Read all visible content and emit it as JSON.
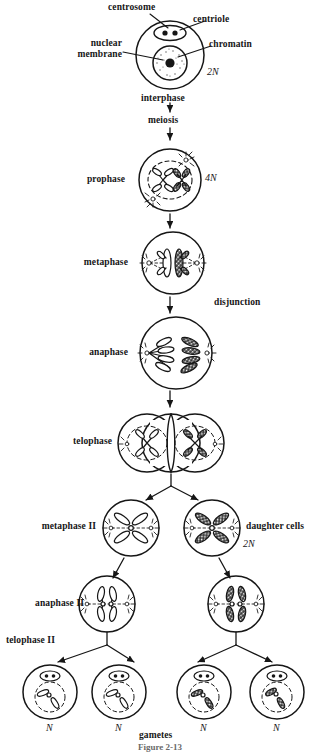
{
  "figure": {
    "caption": "Figure 2-13",
    "ink_color": "#161616",
    "paper_color": "#ffffff"
  },
  "callouts": [
    {
      "name": "centrosome",
      "label": "centrosome"
    },
    {
      "name": "centriole",
      "label": "centriole"
    },
    {
      "name": "nuclear-membrane",
      "label": "nuclear\nmembrane"
    },
    {
      "name": "chromatin",
      "label": "chromatin"
    }
  ],
  "stages": [
    {
      "name": "interphase",
      "label": "interphase",
      "ploidy": "2N"
    },
    {
      "name": "meiosis",
      "label": "meiosis",
      "ploidy": ""
    },
    {
      "name": "prophase",
      "label": "prophase",
      "ploidy": "4N"
    },
    {
      "name": "metaphase",
      "label": "metaphase",
      "ploidy": ""
    },
    {
      "name": "anaphase",
      "label": "anaphase",
      "ploidy": ""
    },
    {
      "name": "telophase",
      "label": "telophase",
      "ploidy": ""
    },
    {
      "name": "metaphase-2",
      "label": "metaphase II",
      "ploidy": ""
    },
    {
      "name": "anaphase-2",
      "label": "anaphase II",
      "ploidy": ""
    },
    {
      "name": "telophase-2",
      "label": "telophase II",
      "ploidy": ""
    }
  ],
  "annotations": {
    "disjunction": "disjunction",
    "daughter_cells": "daughter cells",
    "daughter_cells_ploidy": "2N",
    "gametes": "gametes",
    "interphase_ploidy": "2N",
    "prophase_ploidy": "4N"
  },
  "gametes": [
    {
      "name": "gamete-1",
      "ploidy": "N",
      "chromatid": "light"
    },
    {
      "name": "gamete-2",
      "ploidy": "N",
      "chromatid": "light"
    },
    {
      "name": "gamete-3",
      "ploidy": "N",
      "chromatid": "dark"
    },
    {
      "name": "gamete-4",
      "ploidy": "N",
      "chromatid": "dark"
    }
  ],
  "labels": {
    "interphase": "interphase",
    "meiosis": "meiosis",
    "prophase": "prophase",
    "metaphase": "metaphase",
    "anaphase": "anaphase",
    "telophase": "telophase",
    "metaphase2": "metaphase II",
    "anaphase2": "anaphase II",
    "telophase2": "telophase II",
    "centrosome": "centrosome",
    "centriole": "centriole",
    "nuclear_membrane_1": "nuclear",
    "nuclear_membrane_2": "membrane",
    "chromatin": "chromatin",
    "disjunction": "disjunction",
    "daughter_cells": "daughter cells",
    "gametes": "gametes",
    "n1": "N",
    "n2": "N",
    "n3": "N",
    "n4": "N",
    "twoN_interphase": "2N",
    "fourN_prophase": "4N",
    "twoN_daughter": "2N",
    "caption": "Figure 2-13"
  }
}
